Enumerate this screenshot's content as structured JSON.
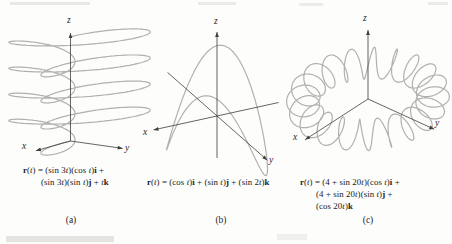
{
  "colors": {
    "curve": "#b0b0ac",
    "axis": "#3e3e3b",
    "text": "#1a1a1a",
    "background": "#fdfdfb"
  },
  "chart_data": [
    {
      "type": "line",
      "id": "a",
      "projection": "oblique-3d",
      "caption": "(a)",
      "axes": {
        "x": "x",
        "y": "y",
        "z": "z"
      },
      "formula_plain": "r(t) = (sin 3t)(cos t)i + (sin 3t)(sin t)j + tk",
      "formula_lines": [
        "[b]r[/b]([i]t[/i]) = (sin 3[i]t[/i])(cos [i]t[/i])[b]i[/b] +",
        "(sin 3[i]t[/i])(sin [i]t[/i])[b]j[/b] + [i]t[/i][b]k[/b]"
      ],
      "components": {
        "x": "sin(3t)cos(t)",
        "y": "sin(3t)sin(t)",
        "z": "t"
      },
      "t_range": [
        0,
        12.566
      ]
    },
    {
      "type": "line",
      "id": "b",
      "projection": "oblique-3d",
      "caption": "(b)",
      "axes": {
        "x": "x",
        "y": "y",
        "z": "z"
      },
      "formula_plain": "r(t) = (cos t)i + (sin t)j + (sin 2t)k",
      "formula_lines": [
        "[b]r[/b]([i]t[/i]) = (cos [i]t[/i])[b]i[/b] + (sin [i]t[/i])[b]j[/b] + (sin 2[i]t[/i])[b]k[/b]"
      ],
      "components": {
        "x": "cos(t)",
        "y": "sin(t)",
        "z": "sin(2t)"
      },
      "t_range": [
        0,
        6.283
      ]
    },
    {
      "type": "line",
      "id": "c",
      "projection": "oblique-3d",
      "caption": "(c)",
      "axes": {
        "x": "x",
        "y": "y",
        "z": "z"
      },
      "formula_plain": "r(t) = (4 + sin 20t)(cos t)i + (4 + sin 20t)(sin t)j + (cos 20t)k",
      "formula_lines": [
        "[b]r[/b]([i]t[/i]) = (4 + sin 20[i]t[/i])(cos [i]t[/i])[b]i[/b] +",
        "(4 + sin 20[i]t[/i])(sin [i]t[/i])[b]j[/b] +",
        "(cos 20[i]t[/i])[b]k[/b]"
      ],
      "components": {
        "x": "(4 + sin(20t))cos(t)",
        "y": "(4 + sin(20t))sin(t)",
        "z": "cos(20t)"
      },
      "t_range": [
        0,
        6.283
      ]
    }
  ]
}
